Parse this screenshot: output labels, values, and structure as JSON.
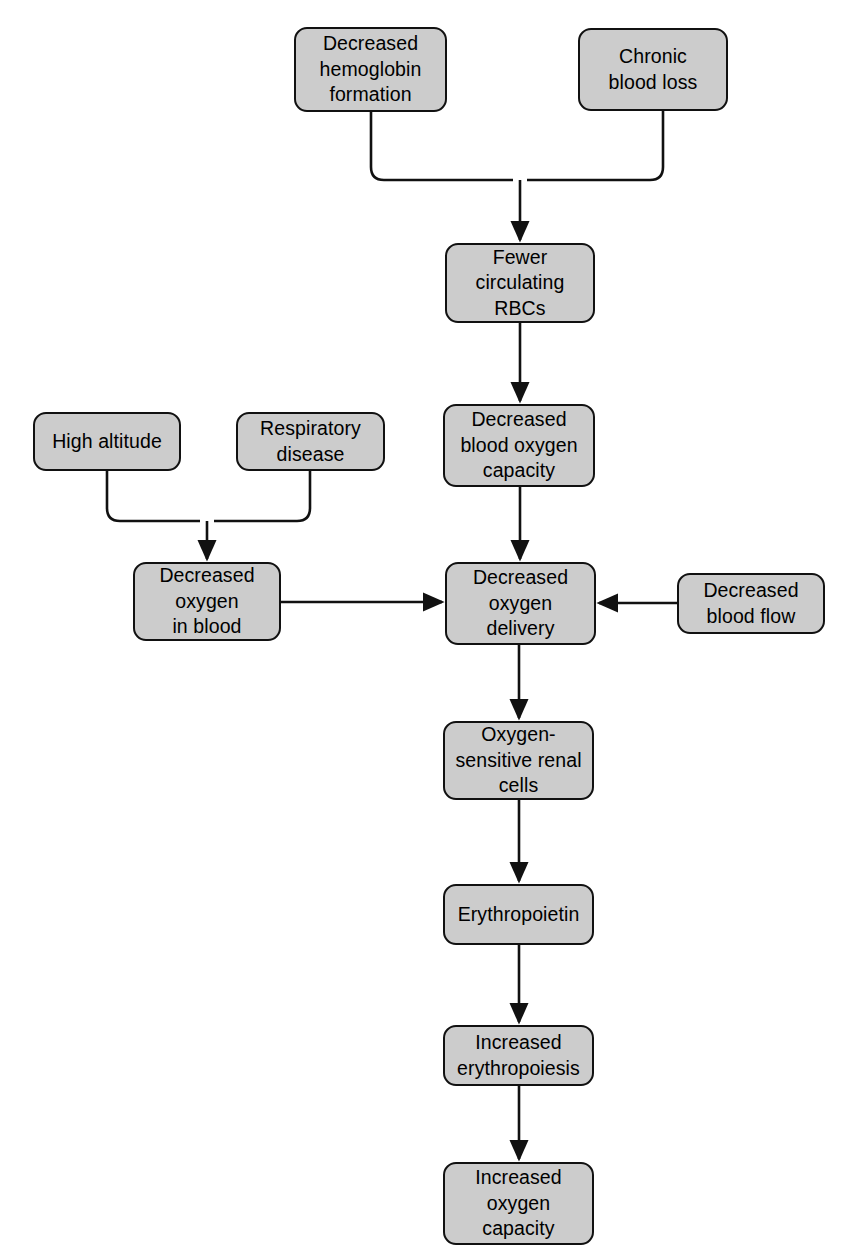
{
  "diagram": {
    "type": "flowchart",
    "background_color": "#ffffff",
    "node_fill_color": "#cccccc",
    "node_border_color": "#111111",
    "edge_color": "#111111",
    "text_color": "#000000"
  },
  "nodes": [
    {
      "id": "decreased-hemoglobin-formation",
      "label": "Decreased\nhemoglobin\nformation",
      "x": 294,
      "y": 27,
      "w": 153,
      "h": 85
    },
    {
      "id": "chronic-blood-loss",
      "label": "Chronic\nblood loss",
      "x": 578,
      "y": 28,
      "w": 150,
      "h": 83
    },
    {
      "id": "fewer-circulating-rbcs",
      "label": "Fewer\ncirculating\nRBCs",
      "x": 445,
      "y": 243,
      "w": 150,
      "h": 80
    },
    {
      "id": "decreased-blood-oxygen-capacity",
      "label": "Decreased\nblood oxygen\ncapacity",
      "x": 443,
      "y": 404,
      "w": 152,
      "h": 83
    },
    {
      "id": "high-altitude",
      "label": "High altitude",
      "x": 33,
      "y": 412,
      "w": 148,
      "h": 59
    },
    {
      "id": "respiratory-disease",
      "label": "Respiratory\ndisease",
      "x": 236,
      "y": 412,
      "w": 149,
      "h": 59
    },
    {
      "id": "decreased-oxygen-in-blood",
      "label": "Decreased\noxygen\nin blood",
      "x": 133,
      "y": 562,
      "w": 148,
      "h": 79
    },
    {
      "id": "decreased-oxygen-delivery",
      "label": "Decreased\noxygen\ndelivery",
      "x": 445,
      "y": 562,
      "w": 151,
      "h": 83
    },
    {
      "id": "decreased-blood-flow",
      "label": "Decreased\nblood flow",
      "x": 677,
      "y": 573,
      "w": 148,
      "h": 61
    },
    {
      "id": "oxygen-sensitive-renal-cells",
      "label": "Oxygen-\nsensitive renal\ncells",
      "x": 443,
      "y": 721,
      "w": 151,
      "h": 79
    },
    {
      "id": "erythropoietin",
      "label": "Erythropoietin",
      "x": 443,
      "y": 884,
      "w": 151,
      "h": 61
    },
    {
      "id": "increased-erythropoiesis",
      "label": "Increased\nerythropoiesis",
      "x": 443,
      "y": 1025,
      "w": 151,
      "h": 61
    },
    {
      "id": "increased-oxygen-capacity",
      "label": "Increased\noxygen\ncapacity",
      "x": 443,
      "y": 1162,
      "w": 151,
      "h": 83
    }
  ],
  "edges": [
    {
      "id": "hemoglobin-to-junction",
      "from": "decreased-hemoglobin-formation",
      "to": "merge-top",
      "kind": "elbow"
    },
    {
      "id": "chronic-to-junction",
      "from": "chronic-blood-loss",
      "to": "merge-top",
      "kind": "elbow"
    },
    {
      "id": "junction-to-fewer-rbcs",
      "from": "merge-top",
      "to": "fewer-circulating-rbcs",
      "kind": "arrow"
    },
    {
      "id": "fewer-rbcs-to-capacity",
      "from": "fewer-circulating-rbcs",
      "to": "decreased-blood-oxygen-capacity",
      "kind": "arrow"
    },
    {
      "id": "capacity-to-delivery",
      "from": "decreased-blood-oxygen-capacity",
      "to": "decreased-oxygen-delivery",
      "kind": "arrow"
    },
    {
      "id": "altitude-to-junction",
      "from": "high-altitude",
      "to": "merge-left",
      "kind": "elbow"
    },
    {
      "id": "respiratory-to-junction",
      "from": "respiratory-disease",
      "to": "merge-left",
      "kind": "elbow"
    },
    {
      "id": "junction-to-oxygen-in-blood",
      "from": "merge-left",
      "to": "decreased-oxygen-in-blood",
      "kind": "arrow"
    },
    {
      "id": "oxygen-in-blood-to-delivery",
      "from": "decreased-oxygen-in-blood",
      "to": "decreased-oxygen-delivery",
      "kind": "arrow"
    },
    {
      "id": "blood-flow-to-delivery",
      "from": "decreased-blood-flow",
      "to": "decreased-oxygen-delivery",
      "kind": "arrow"
    },
    {
      "id": "delivery-to-renal-cells",
      "from": "decreased-oxygen-delivery",
      "to": "oxygen-sensitive-renal-cells",
      "kind": "arrow"
    },
    {
      "id": "renal-cells-to-erythropoietin",
      "from": "oxygen-sensitive-renal-cells",
      "to": "erythropoietin",
      "kind": "arrow"
    },
    {
      "id": "erythropoietin-to-erythropoiesis",
      "from": "erythropoietin",
      "to": "increased-erythropoiesis",
      "kind": "arrow"
    },
    {
      "id": "erythropoiesis-to-oxygen-capacity",
      "from": "increased-erythropoiesis",
      "to": "increased-oxygen-capacity",
      "kind": "arrow"
    }
  ]
}
